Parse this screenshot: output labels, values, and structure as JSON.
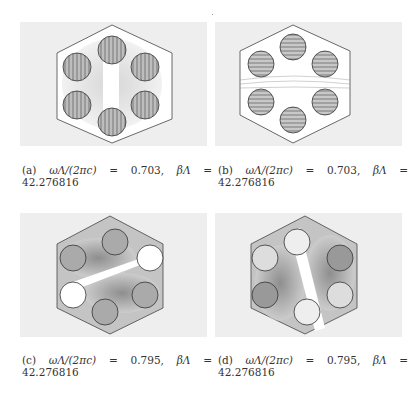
{
  "figure": {
    "subfigures": [
      {
        "label": "(a)",
        "freq_expr": "ωΛ/(2πc)",
        "eq": "=",
        "freq": "0.703,",
        "beta_expr": "βΛ",
        "eq2": "=",
        "beta": "42.276816",
        "pattern": "vertical-stripes"
      },
      {
        "label": "(b)",
        "freq_expr": "ωΛ/(2πc)",
        "eq": "=",
        "freq": "0.703,",
        "beta_expr": "βΛ",
        "eq2": "=",
        "beta": "42.276816",
        "pattern": "horizontal-stripes"
      },
      {
        "label": "(c)",
        "freq_expr": "ωΛ/(2πc)",
        "eq": "=",
        "freq": "0.795,",
        "beta_expr": "βΛ",
        "eq2": "=",
        "beta": "42.276816",
        "pattern": "diagonal-node-ascending"
      },
      {
        "label": "(d)",
        "freq_expr": "ωΛ/(2πc)",
        "eq": "=",
        "freq": "0.795,",
        "beta_expr": "βΛ",
        "eq2": "=",
        "beta": "42.276816",
        "pattern": "diagonal-node-descending"
      }
    ]
  }
}
